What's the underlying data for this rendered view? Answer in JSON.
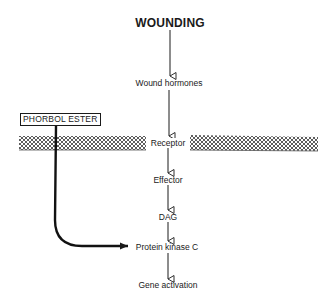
{
  "diagram": {
    "title": "WOUNDING",
    "nodes": [
      {
        "id": "wound_hormones",
        "label": "Wound hormones"
      },
      {
        "id": "receptor",
        "label": "Receptor"
      },
      {
        "id": "effector",
        "label": "Effector"
      },
      {
        "id": "dag",
        "label": "DAG"
      },
      {
        "id": "pkc",
        "label": "Protein kinase C"
      },
      {
        "id": "gene_activation",
        "label": "Gene activation"
      }
    ],
    "external_input": {
      "label": "PHORBOL ESTER",
      "target": "pkc"
    },
    "membrane": {
      "label": "cell membrane (hatched)"
    },
    "edges": [
      {
        "from": "WOUNDING",
        "to": "wound_hormones"
      },
      {
        "from": "wound_hormones",
        "to": "receptor"
      },
      {
        "from": "receptor",
        "to": "effector"
      },
      {
        "from": "effector",
        "to": "dag"
      },
      {
        "from": "dag",
        "to": "pkc"
      },
      {
        "from": "pkc",
        "to": "gene_activation"
      },
      {
        "from": "PHORBOL ESTER",
        "to": "pkc",
        "style": "thick-curved"
      }
    ],
    "colors": {
      "ink": "#1a1a1a",
      "background": "#ffffff"
    }
  }
}
